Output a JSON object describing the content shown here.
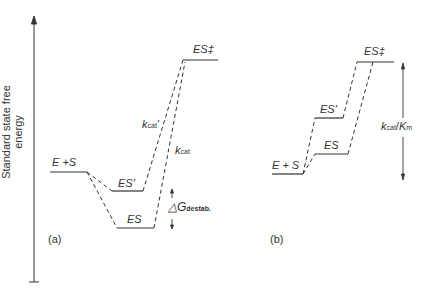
{
  "axis": {
    "ylabel": "Standard state free energy"
  },
  "panel_a": {
    "label": "(a)",
    "states": {
      "e_plus_s": "E +S",
      "es_prime": "ES'",
      "es": "ES",
      "es_ts": "ES‡"
    },
    "rate_labels": {
      "kcat_prime_k": "k",
      "kcat_prime_sub": "cat",
      "kcat_prime_mark": "'",
      "kcat_k": "k",
      "kcat_sub": "cat"
    },
    "destab": {
      "delta_g": "△G",
      "sub": "destab."
    }
  },
  "panel_b": {
    "label": "(b)",
    "states": {
      "e_plus_s": "E + S",
      "es_prime": "ES'",
      "es": "ES",
      "es_ts": "ES‡"
    },
    "ratio": {
      "k": "k",
      "k_sub": "cat",
      "slash": "/",
      "K": "K",
      "K_sub": "m"
    }
  },
  "colors": {
    "line": "#333333",
    "background": "#ffffff"
  }
}
